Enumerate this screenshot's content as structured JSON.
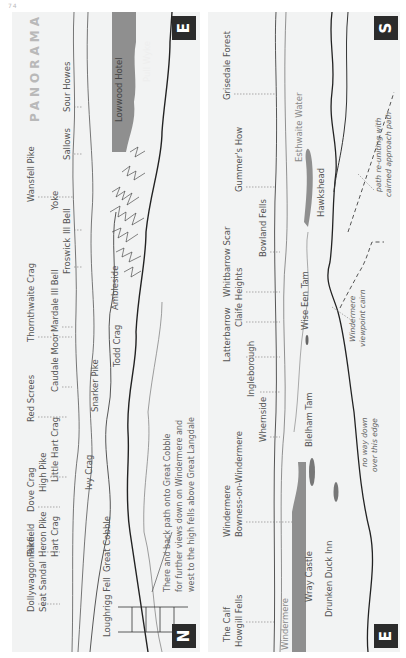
{
  "page": {
    "header": "74"
  },
  "title": "PANORAMA",
  "left_panel": {
    "start_badge": "N",
    "end_badge": "E",
    "far_labels": [
      {
        "text": "Dollywaggon Pike",
        "x": 14,
        "y": 600
      },
      {
        "text": "Seat Sandal",
        "x": 26,
        "y": 600
      },
      {
        "text": "Fairfield",
        "x": 14,
        "y": 545
      },
      {
        "text": "Heron Pike",
        "x": 26,
        "y": 545
      },
      {
        "text": "Hart Crag",
        "x": 38,
        "y": 545
      },
      {
        "text": "Dove Crag",
        "x": 14,
        "y": 500
      },
      {
        "text": "High Pike",
        "x": 26,
        "y": 480
      },
      {
        "text": "Little Hart Crag",
        "x": 38,
        "y": 470
      },
      {
        "text": "Red Screes",
        "x": 14,
        "y": 410
      },
      {
        "text": "Caudale Moor",
        "x": 38,
        "y": 380
      },
      {
        "text": "Thornthwaite Crag",
        "x": 14,
        "y": 330
      },
      {
        "text": "Mardale Ill Bell",
        "x": 38,
        "y": 320
      },
      {
        "text": "Froswick",
        "x": 50,
        "y": 262
      },
      {
        "text": "Ill Bell",
        "x": 50,
        "y": 222
      },
      {
        "text": "Yoke",
        "x": 38,
        "y": 198
      },
      {
        "text": "Wansfell Pike",
        "x": 14,
        "y": 190
      },
      {
        "text": "Sallows",
        "x": 50,
        "y": 148
      },
      {
        "text": "Sour Howes",
        "x": 50,
        "y": 100
      }
    ],
    "near_labels": [
      {
        "text": "Loughrigg Fell",
        "x": 90,
        "y": 625
      },
      {
        "text": "Great Cobble",
        "x": 90,
        "y": 560
      },
      {
        "text": "Ivy Crag",
        "x": 72,
        "y": 478
      },
      {
        "text": "Snarker Pike",
        "x": 78,
        "y": 400
      },
      {
        "text": "Todd Crag",
        "x": 100,
        "y": 355
      },
      {
        "text": "Ambleside",
        "x": 98,
        "y": 298
      },
      {
        "text": "Lowwood Hotel",
        "x": 102,
        "y": 110
      },
      {
        "text": "Pull Wyke",
        "x": 130,
        "y": 70
      }
    ],
    "note": [
      "There and back path onto Great Cobble",
      "for further views down on Windermere and",
      "west to the high fells above Great Langdale"
    ]
  },
  "right_panel": {
    "start_badge": "E",
    "end_badge": "S",
    "far_labels": [
      {
        "text": "The Calf",
        "x": 14,
        "y": 630
      },
      {
        "text": "Howgill Fells",
        "x": 26,
        "y": 635
      },
      {
        "text": "Windermere",
        "x": 14,
        "y": 525
      },
      {
        "text": "Bowness-on-Windermere",
        "x": 26,
        "y": 525
      },
      {
        "text": "Whernside",
        "x": 50,
        "y": 430
      },
      {
        "text": "Ingleborough",
        "x": 38,
        "y": 385
      },
      {
        "text": "Latterbarrow",
        "x": 14,
        "y": 350
      },
      {
        "text": "Claife Heights",
        "x": 26,
        "y": 315
      },
      {
        "text": "Whitbarrow Scar",
        "x": 14,
        "y": 285
      },
      {
        "text": "Bowland Fells",
        "x": 50,
        "y": 245
      },
      {
        "text": "Gummer's How",
        "x": 26,
        "y": 180
      },
      {
        "text": "Grisedale Forest",
        "x": 14,
        "y": 88
      }
    ],
    "near_labels": [
      {
        "text": "Windermere",
        "x": 72,
        "y": 638,
        "water": true
      },
      {
        "text": "Wray Castle",
        "x": 96,
        "y": 590
      },
      {
        "text": "Drunken Duck Inn",
        "x": 116,
        "y": 605
      },
      {
        "text": "Blelham Tam",
        "x": 96,
        "y": 435
      },
      {
        "text": "Wise Een Tam",
        "x": 92,
        "y": 318
      },
      {
        "text": "Hawkshead",
        "x": 108,
        "y": 205
      },
      {
        "text": "Esthwaite Water",
        "x": 86,
        "y": 150,
        "water": true
      }
    ],
    "italic_notes": [
      {
        "lines": [
          "Windermere",
          "viewpoint cairn"
        ],
        "x": 140,
        "y": 320
      },
      {
        "lines": [
          "no way down",
          "over this edge"
        ],
        "x": 152,
        "y": 450
      },
      {
        "lines": [
          "path re-uniting with",
          "cairned approach path"
        ],
        "x": 160,
        "y": 170
      }
    ]
  },
  "colors": {
    "panel_bg": "#f2f3f3",
    "water": "#8f8f8f",
    "badge_bg": "#2b2b2b",
    "badge_fg": "#ffffff",
    "title": "#b9b9b9",
    "line": "#333333"
  }
}
